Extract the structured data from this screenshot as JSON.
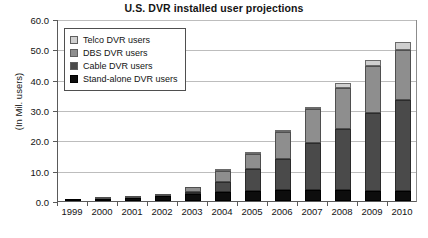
{
  "chart_data": {
    "type": "bar",
    "subtype": "stacked-column",
    "title": "U.S. DVR installed user projections",
    "xlabel": "",
    "ylabel": "(In Mil. users)",
    "ylim": [
      0.0,
      60.0
    ],
    "ytick_step": 10.0,
    "ytick_labels": [
      "60.0",
      "50.0",
      "40.0",
      "30.0",
      "20.0",
      "10.0",
      "0.0"
    ],
    "ytick_values": [
      60.0,
      50.0,
      40.0,
      30.0,
      20.0,
      10.0,
      0.0
    ],
    "grid": true,
    "legend_position": "top-left-inside",
    "categories": [
      "1999",
      "2000",
      "2001",
      "2002",
      "2003",
      "2004",
      "2005",
      "2006",
      "2007",
      "2008",
      "2009",
      "2010"
    ],
    "series": [
      {
        "name": "Stand-alone DVR users",
        "color": "#0d0d0d",
        "values": [
          0.3,
          0.6,
          1.0,
          1.6,
          2.3,
          3.0,
          3.4,
          3.6,
          3.6,
          3.5,
          3.4,
          3.2
        ]
      },
      {
        "name": "Cable DVR users",
        "color": "#4a4a4a",
        "values": [
          0.0,
          0.0,
          0.0,
          0.0,
          0.5,
          3.2,
          7.0,
          10.2,
          15.6,
          20.3,
          25.5,
          30.0
        ]
      },
      {
        "name": "DBS DVR users",
        "color": "#8e8e8e",
        "values": [
          0.0,
          0.1,
          0.3,
          0.8,
          1.5,
          3.6,
          5.2,
          8.8,
          11.0,
          13.5,
          15.5,
          16.5
        ]
      },
      {
        "name": "Telco DVR users",
        "color": "#cfcfcf",
        "values": [
          0.0,
          0.0,
          0.0,
          0.0,
          0.0,
          0.2,
          0.3,
          0.4,
          0.8,
          1.5,
          2.0,
          2.8
        ]
      }
    ],
    "totals": [
      0.3,
      0.7,
      1.3,
      2.4,
      4.3,
      10.0,
      15.9,
      23.0,
      31.0,
      38.8,
      46.4,
      52.5
    ]
  },
  "legend": {
    "items": [
      {
        "label": "Telco DVR users",
        "color": "#cfcfcf"
      },
      {
        "label": "DBS DVR users",
        "color": "#8e8e8e"
      },
      {
        "label": "Cable DVR users",
        "color": "#4a4a4a"
      },
      {
        "label": "Stand-alone DVR users",
        "color": "#0d0d0d"
      }
    ]
  }
}
